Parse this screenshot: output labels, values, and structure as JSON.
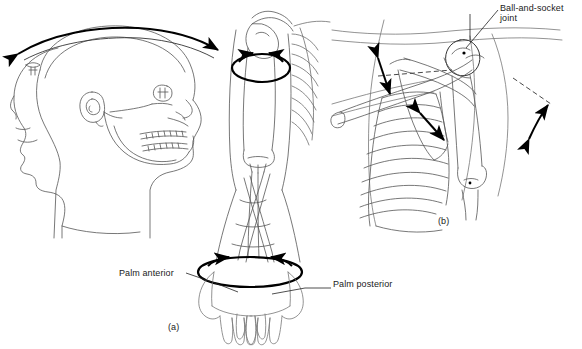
{
  "figure": {
    "background_color": "#ffffff",
    "ink_color": "#000000",
    "bone_outline_color": "#555555",
    "arrow_color": "#000000",
    "width": 582,
    "height": 349
  },
  "labels": {
    "palm_anterior": "Palm anterior",
    "palm_posterior": "Palm posterior",
    "ball_and_socket_line1": "Ball-and-socket",
    "ball_and_socket_line2": "joint",
    "panel_a": "(a)",
    "panel_b": "(b)"
  },
  "panels": [
    {
      "id": "a",
      "caption": "(a)",
      "subjects": [
        "head-profile-rotation",
        "humerus-rotation",
        "forearm-pronation-supination",
        "hands-palm-anterior-posterior"
      ],
      "annotations": [
        "head-rotation-arrow",
        "humerus-rotation-ellipse-arrow",
        "wrist-rotation-ellipse-arrow"
      ]
    },
    {
      "id": "b",
      "caption": "(b)",
      "subjects": [
        "clavicle",
        "scapula",
        "rib-cage",
        "humerus",
        "shoulder-joint"
      ],
      "annotations": [
        "clavicle-elevation-arrow",
        "scapula-glide-arrow",
        "arm-abduction-arrow",
        "ball-and-socket-leader-line"
      ]
    }
  ],
  "icons": {
    "double_arrow": "double-headed-arrow",
    "rotation_ellipse": "rotation-ellipse-arrow",
    "leader_line": "leader-line"
  }
}
